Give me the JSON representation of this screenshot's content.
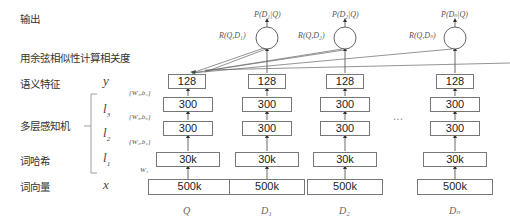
{
  "left_labels": {
    "output": "输出",
    "cosine": "用余弦相似性计算相关度",
    "semantic": "语义特征",
    "mlp": "多层感知机",
    "word_hashing": "词哈希",
    "word_vector": "词向量"
  },
  "vars": {
    "y": "y",
    "l3": "l",
    "l3_sub": "3",
    "l2": "l",
    "l2_sub": "2",
    "l1": "l",
    "l1_sub": "1",
    "x": "x"
  },
  "weights": {
    "w4": "{W₄,b₄}",
    "w3": "{W₃,b₃}",
    "w2": "{W₂,b₂}",
    "w1": "W₁"
  },
  "columns": [
    {
      "name": "Q",
      "layers": [
        "128",
        "300",
        "300",
        "30k",
        "500k"
      ]
    },
    {
      "name": "D₁",
      "relevance": "R(Q,D₁)",
      "posterior": "P(D₁|Q)",
      "layers": [
        "128",
        "300",
        "300",
        "30k",
        "500k"
      ]
    },
    {
      "name": "D₂",
      "relevance": "R(Q,D₂)",
      "posterior": "P(D₂|Q)",
      "layers": [
        "128",
        "300",
        "300",
        "30k",
        "500k"
      ]
    },
    {
      "name": "Dₙ",
      "relevance": "R(Q,Dₙ)",
      "posterior": "P(Dₙ|Q)",
      "layers": [
        "128",
        "300",
        "300",
        "30k",
        "500k"
      ]
    }
  ],
  "ellipsis": "..."
}
